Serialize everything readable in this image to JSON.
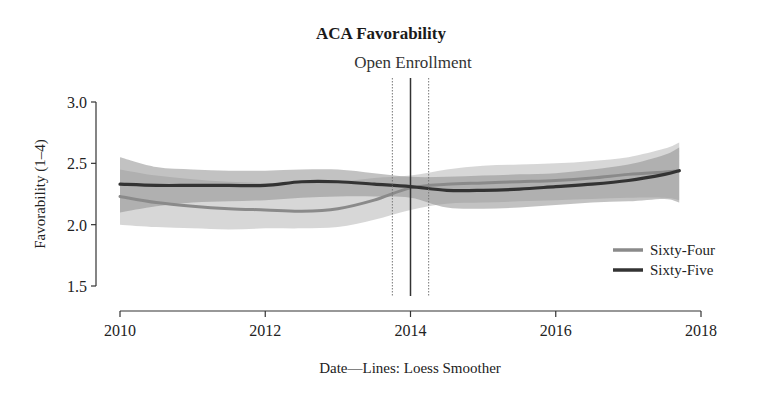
{
  "chart_data": {
    "type": "line",
    "title": "ACA Favorability",
    "annotation": "Open Enrollment",
    "xlabel": "Date—Lines: Loess Smoother",
    "ylabel": "Favorability (1–4)",
    "xlim": [
      2010,
      2018
    ],
    "ylim": [
      1.5,
      3.0
    ],
    "xticks": [
      2010,
      2012,
      2014,
      2016,
      2018
    ],
    "yticks": [
      1.5,
      2.0,
      2.5,
      3.0
    ],
    "ytick_labels": [
      "1.5",
      "2.0",
      "2.5",
      "3.0"
    ],
    "grid": false,
    "legend_position": "right",
    "vertical_lines": [
      {
        "x": 2014.0,
        "style": "solid"
      },
      {
        "x": 2013.75,
        "style": "dotted"
      },
      {
        "x": 2014.25,
        "style": "dotted"
      }
    ],
    "x": [
      2010,
      2010.5,
      2011,
      2011.5,
      2012,
      2012.5,
      2013,
      2013.5,
      2014,
      2014.5,
      2015,
      2015.5,
      2016,
      2016.5,
      2017,
      2017.5,
      2017.7
    ],
    "series": [
      {
        "name": "Sixty-Four",
        "color": "#8a8a8a",
        "band_color": "#bdbdbd",
        "values": [
          2.23,
          2.18,
          2.15,
          2.13,
          2.12,
          2.11,
          2.13,
          2.2,
          2.3,
          2.33,
          2.34,
          2.35,
          2.36,
          2.38,
          2.41,
          2.43,
          2.44
        ],
        "upper": [
          2.45,
          2.4,
          2.37,
          2.35,
          2.34,
          2.34,
          2.35,
          2.38,
          2.4,
          2.45,
          2.48,
          2.49,
          2.5,
          2.52,
          2.55,
          2.62,
          2.67
        ],
        "lower": [
          2.0,
          1.98,
          1.97,
          1.96,
          1.97,
          1.97,
          1.98,
          2.04,
          2.12,
          2.17,
          2.18,
          2.19,
          2.2,
          2.21,
          2.22,
          2.22,
          2.2
        ]
      },
      {
        "name": "Sixty-Five",
        "color": "#333333",
        "band_color": "#8f8f8f",
        "values": [
          2.33,
          2.32,
          2.32,
          2.32,
          2.32,
          2.35,
          2.35,
          2.33,
          2.31,
          2.28,
          2.28,
          2.29,
          2.31,
          2.33,
          2.36,
          2.41,
          2.44
        ],
        "upper": [
          2.55,
          2.47,
          2.45,
          2.44,
          2.44,
          2.45,
          2.45,
          2.42,
          2.39,
          2.39,
          2.4,
          2.41,
          2.42,
          2.45,
          2.49,
          2.57,
          2.63
        ],
        "lower": [
          2.1,
          2.15,
          2.18,
          2.19,
          2.2,
          2.22,
          2.23,
          2.23,
          2.22,
          2.14,
          2.13,
          2.14,
          2.16,
          2.18,
          2.19,
          2.21,
          2.18
        ]
      }
    ]
  }
}
